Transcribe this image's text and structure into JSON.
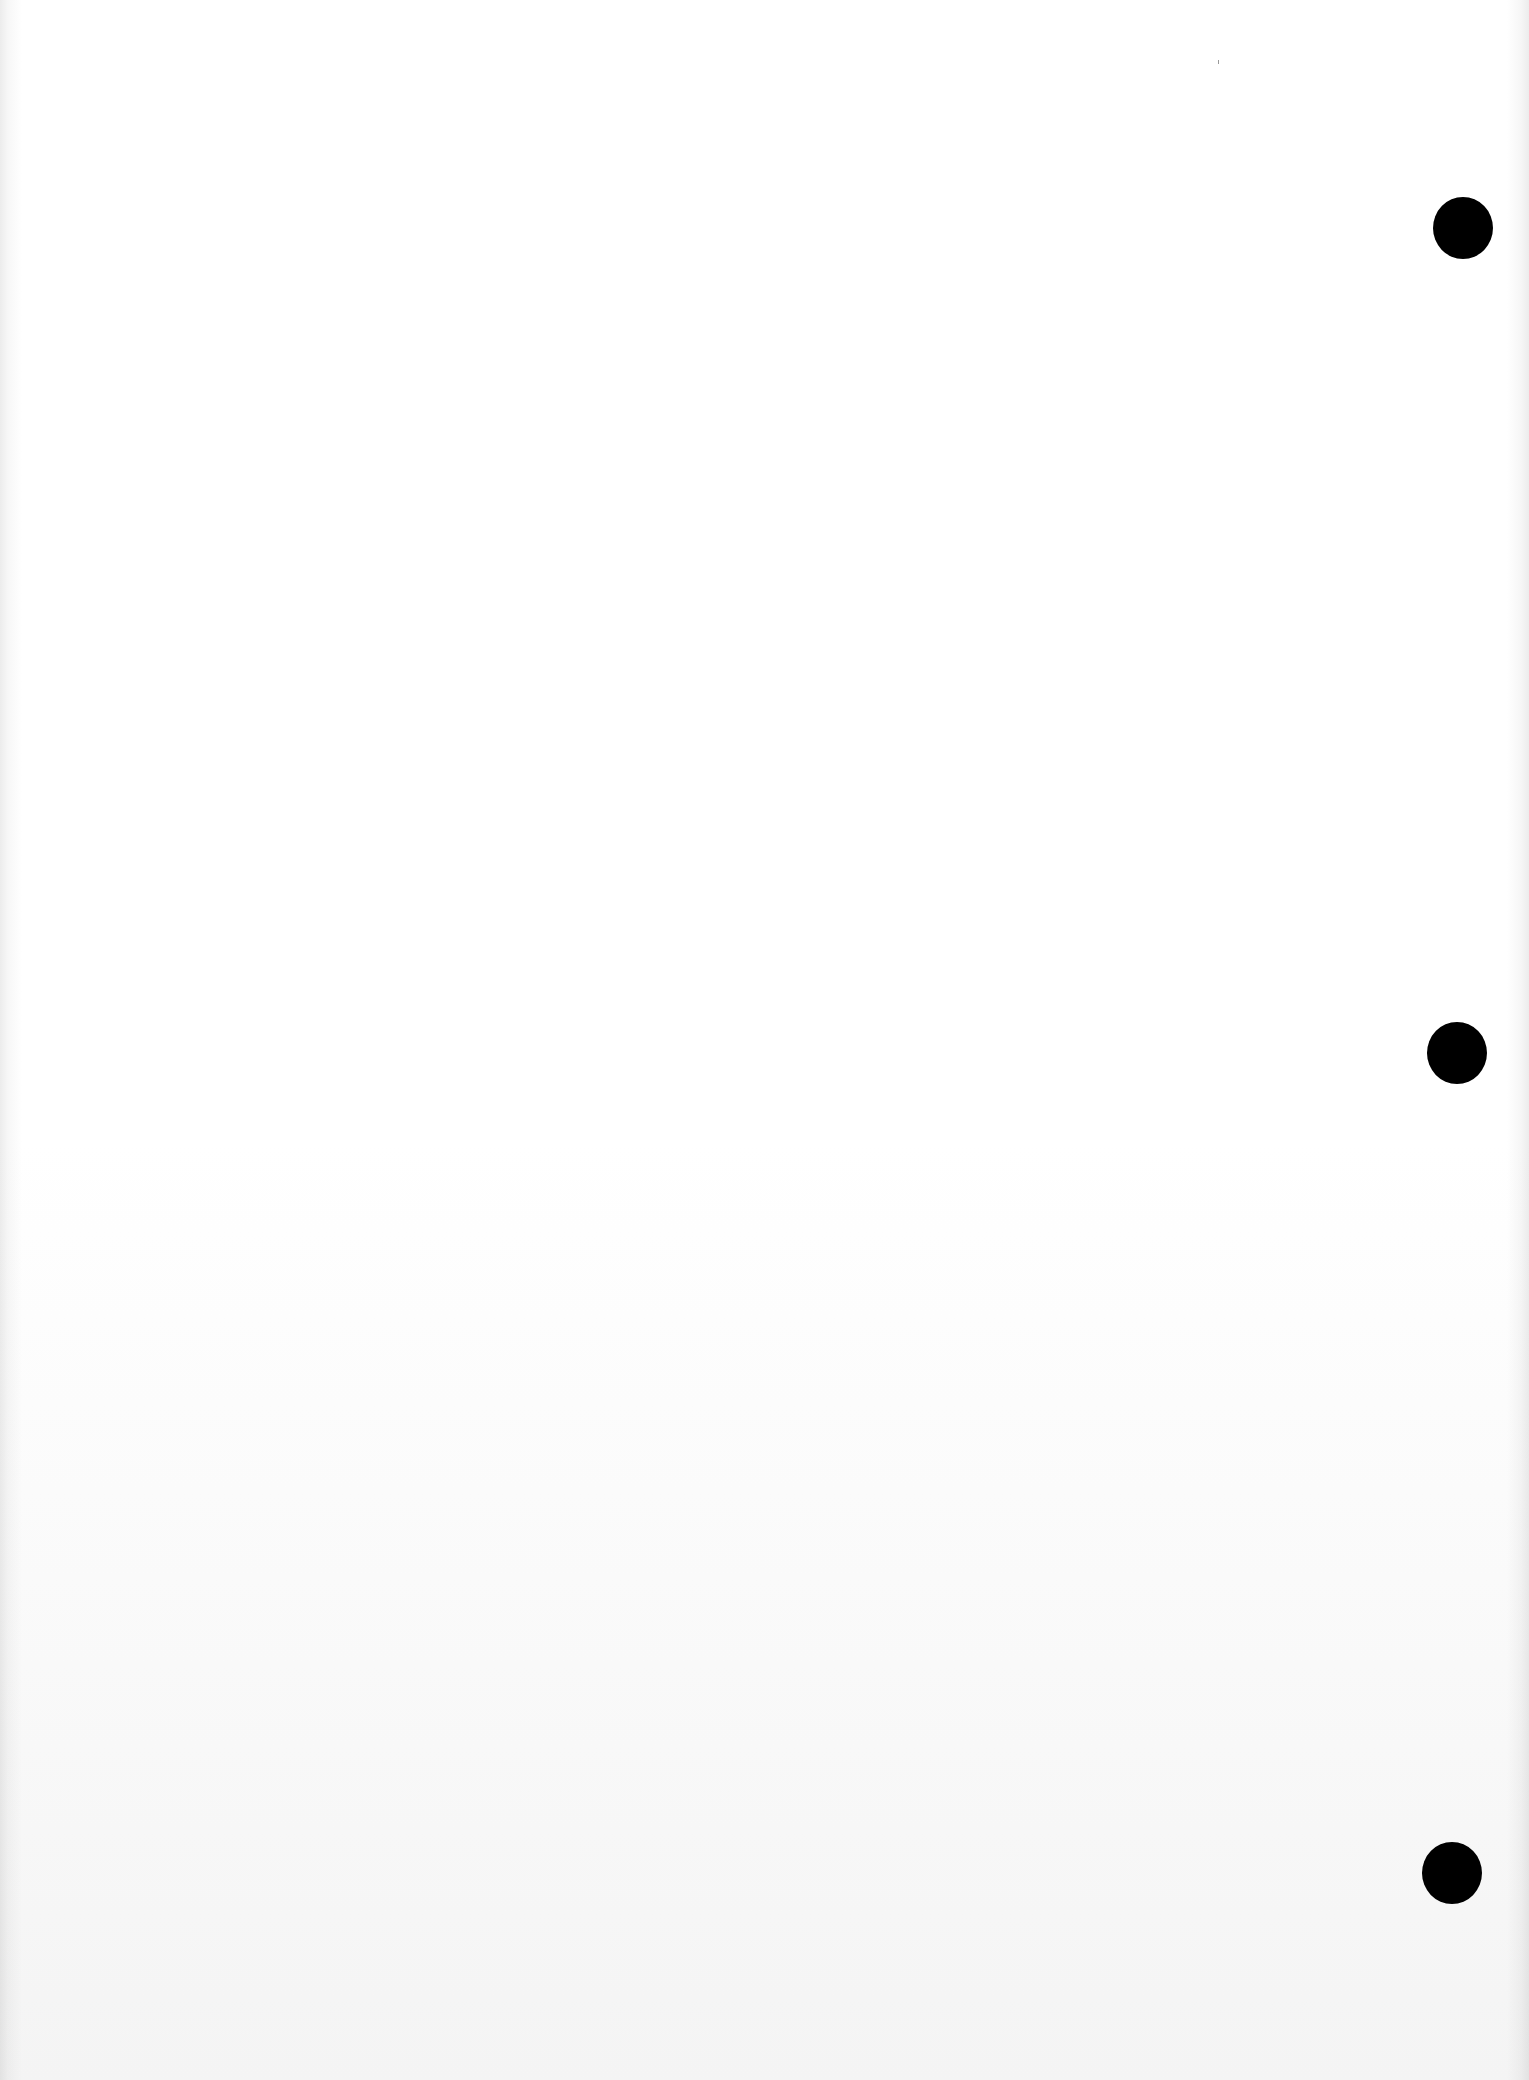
{
  "document": {
    "type": "blank scanned page",
    "text_content": "",
    "punch_holes": [
      {
        "position": "top-right",
        "color": "#000000"
      },
      {
        "position": "middle-right",
        "color": "#000000"
      },
      {
        "position": "bottom-right",
        "color": "#000000"
      }
    ],
    "colors": {
      "paper": "#ffffff",
      "hole": "#000000"
    }
  }
}
